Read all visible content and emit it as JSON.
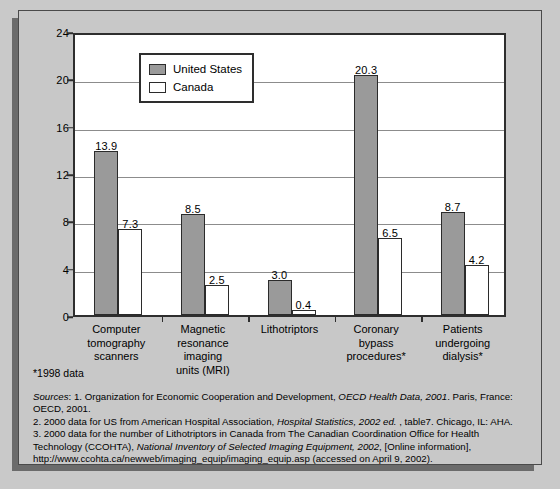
{
  "chart_data": {
    "type": "bar",
    "title": "",
    "xlabel": "",
    "ylabel": "",
    "ylim": [
      0,
      24
    ],
    "yticks": [
      "0",
      "4",
      "8",
      "12",
      "16",
      "20",
      "24"
    ],
    "grid": true,
    "legend_position": "top-left-inside",
    "categories": [
      "Computer\ntomography\nscanners",
      "Magnetic\nresonance\nimaging\nunits (MRI)",
      "Lithotriptors",
      "Coronary\nbypass\nprocedures*",
      "Patients\nundergoing\ndialysis*"
    ],
    "series": [
      {
        "name": "United States",
        "color": "#9a9a9a",
        "values": [
          13.9,
          8.5,
          3.0,
          20.3,
          8.7
        ],
        "labels": [
          "13.9",
          "8.5",
          "3.0",
          "20.3",
          "8.7"
        ]
      },
      {
        "name": "Canada",
        "color": "#ffffff",
        "values": [
          7.3,
          2.5,
          0.4,
          6.5,
          4.2
        ],
        "labels": [
          "7.3",
          "2.5",
          "0.4",
          "6.5",
          "4.2"
        ]
      }
    ]
  },
  "legend": {
    "items": [
      {
        "label": "United States",
        "swatch": "us"
      },
      {
        "label": "Canada",
        "swatch": "canada"
      }
    ]
  },
  "footnote": "*1998 data",
  "sources": {
    "lead_italic": "Sources",
    "line1_a": ": 1. Organization for Economic Cooperation and Development, ",
    "line1_it": "OECD Health Data, 2001",
    "line1_b": ". Paris, France:",
    "line2": "OECD, 2001.",
    "line3_a": "2. 2000 data for US from American Hospital Association, ",
    "line3_it": "Hospital Statistics, 2002 ed.",
    "line3_b": " , table7. Chicago, IL: AHA.",
    "line4": "3. 2000 data for the number of Lithotriptors in Canada from The Canadian Coordination Office for Health",
    "line5_a": "Technology (CCOHTA), ",
    "line5_it": "National Inventory of Selected Imaging Equipment, 2002",
    "line5_b": ", [Online information],",
    "line6": "http://www.ccohta.ca/newweb/imaging_equip/imaging_equip.asp (accessed on April 9, 2002)."
  }
}
